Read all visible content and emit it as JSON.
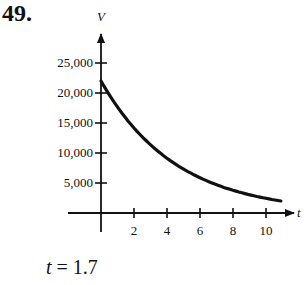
{
  "problem": {
    "number": "49.",
    "answer_var": "t",
    "answer_eq": " = 1.7"
  },
  "chart_data": {
    "type": "line",
    "title": "",
    "xlabel": "t",
    "ylabel": "V",
    "x_ticks": [
      2,
      4,
      6,
      8,
      10
    ],
    "x_tick_labels": [
      "2",
      "4",
      "6",
      "8",
      "10"
    ],
    "y_ticks": [
      5000,
      10000,
      15000,
      20000,
      25000
    ],
    "y_tick_labels": [
      "5,000",
      "10,000",
      "15,000",
      "20,000",
      "25,000"
    ],
    "xlim": [
      0,
      11
    ],
    "ylim": [
      0,
      27000
    ],
    "grid": false,
    "series": [
      {
        "name": "V(t)",
        "x": [
          0,
          1,
          2,
          3,
          4,
          5,
          6,
          7,
          8,
          9,
          10,
          10.9
        ],
        "values": [
          22000,
          17700,
          14200,
          11400,
          9200,
          7400,
          5900,
          4700,
          3800,
          3100,
          2400,
          2000
        ]
      }
    ],
    "annotation": "t = 1.7"
  }
}
